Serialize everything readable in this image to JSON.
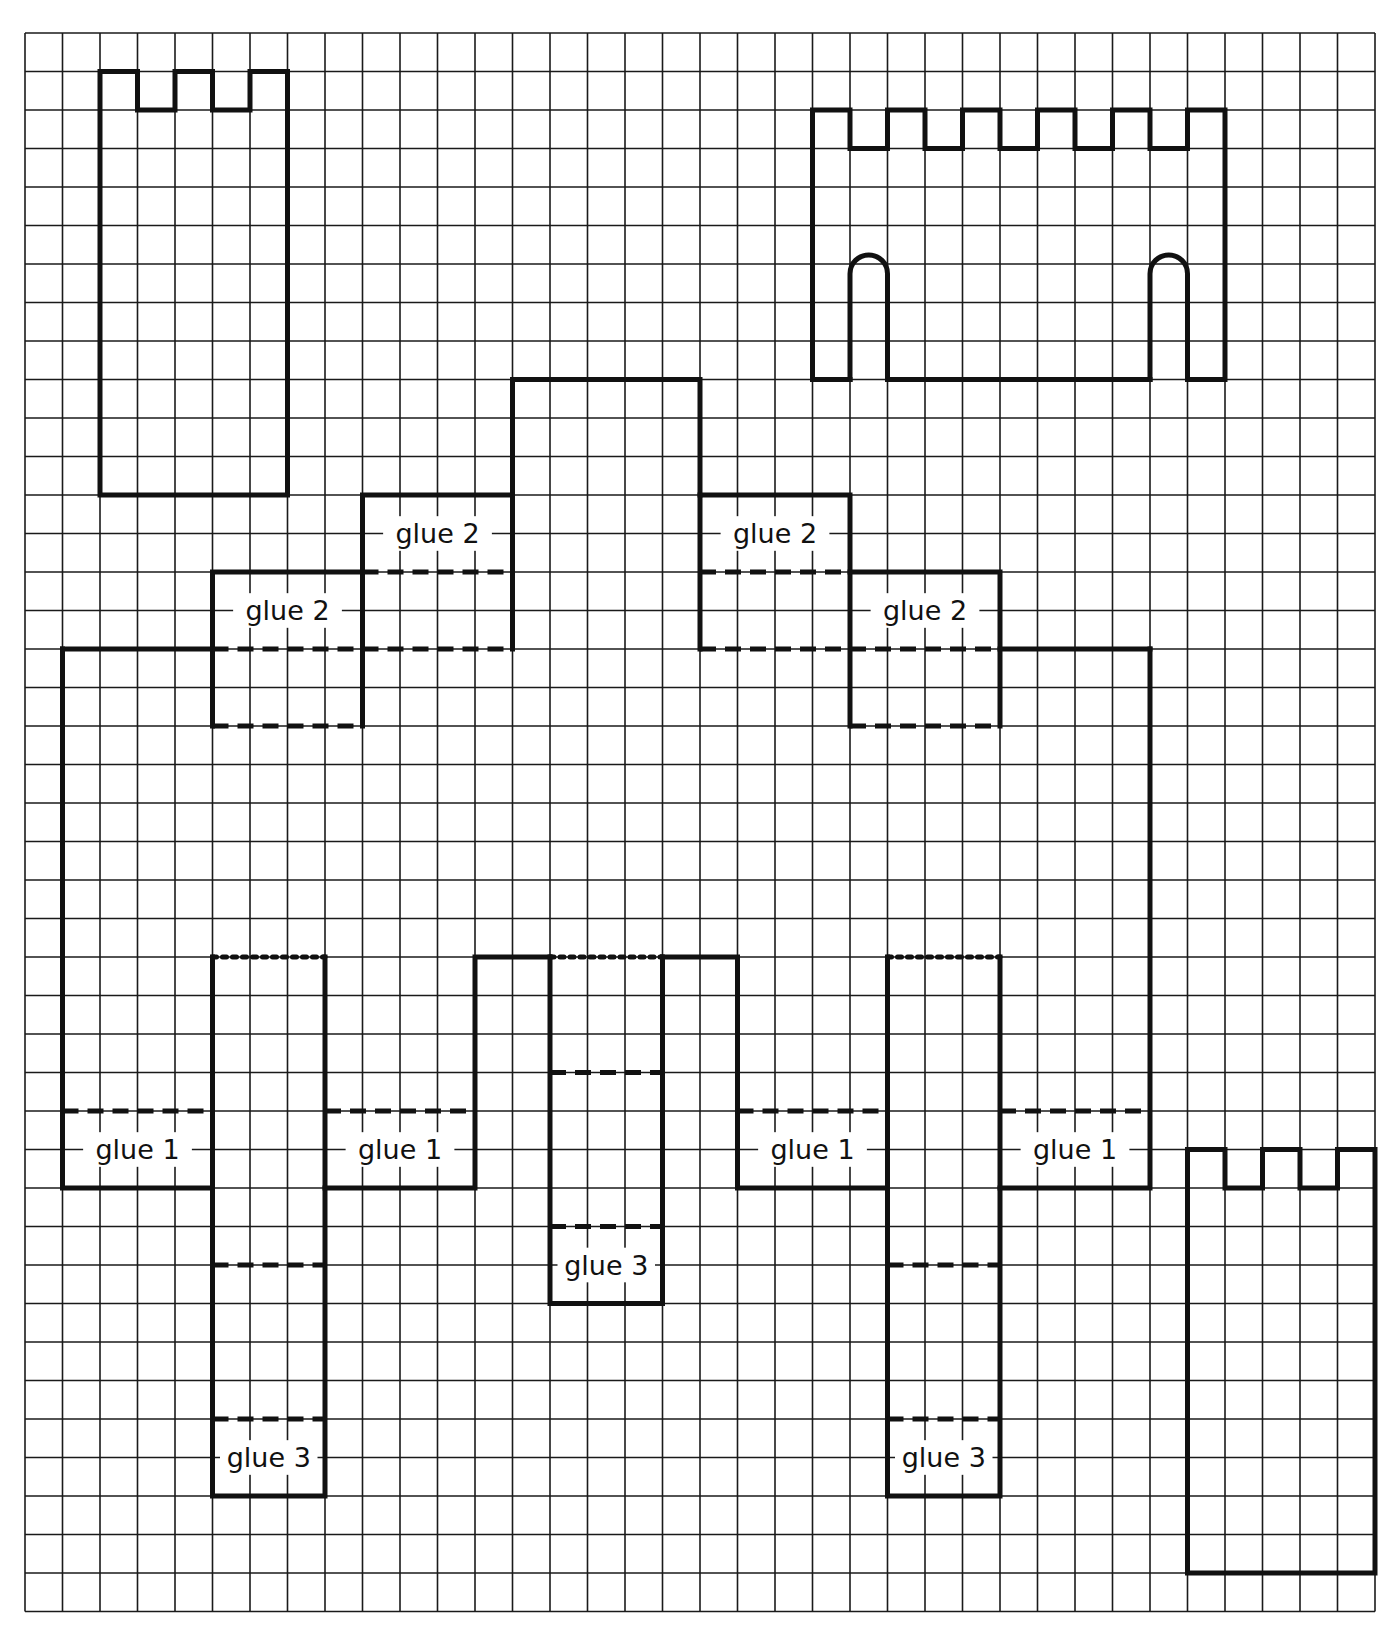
{
  "sheet": {
    "grid": {
      "cols": 36,
      "rows": 41,
      "origin_x": 25,
      "origin_y": 33,
      "cell_w": 37.5,
      "cell_h": 38.5
    },
    "colors": {
      "ink": "#111111",
      "grid": "#1a1a1a",
      "paper": "#ffffff"
    }
  },
  "pieces": [
    {
      "name": "tower-top-left",
      "cut_paths": [
        [
          [
            2,
            12
          ],
          [
            2,
            1
          ],
          [
            3,
            1
          ],
          [
            3,
            2
          ],
          [
            4,
            2
          ],
          [
            4,
            1
          ],
          [
            5,
            1
          ],
          [
            5,
            2
          ],
          [
            6,
            2
          ],
          [
            6,
            1
          ],
          [
            7,
            1
          ],
          [
            7,
            12
          ],
          [
            2,
            12
          ]
        ]
      ]
    },
    {
      "name": "gatehouse-wall-top-right",
      "cut_paths": [
        [
          [
            21,
            9
          ],
          [
            21,
            2
          ],
          [
            22,
            2
          ],
          [
            22,
            3
          ],
          [
            23,
            3
          ],
          [
            23,
            2
          ],
          [
            24,
            2
          ],
          [
            24,
            3
          ],
          [
            25,
            3
          ],
          [
            25,
            2
          ],
          [
            26,
            2
          ],
          [
            26,
            3
          ],
          [
            27,
            3
          ],
          [
            27,
            2
          ],
          [
            28,
            2
          ],
          [
            28,
            3
          ],
          [
            29,
            3
          ],
          [
            29,
            2
          ],
          [
            30,
            2
          ],
          [
            30,
            3
          ],
          [
            31,
            3
          ],
          [
            31,
            2
          ],
          [
            32,
            2
          ],
          [
            32,
            9
          ],
          [
            31,
            9
          ]
        ],
        [
          [
            23,
            9
          ],
          [
            30,
            9
          ]
        ],
        [
          [
            21,
            9
          ],
          [
            22,
            9
          ]
        ]
      ],
      "arches": [
        {
          "left_col": 22,
          "right_col": 23,
          "spring_row": 6.25,
          "base_row": 9
        },
        {
          "left_col": 30,
          "right_col": 31,
          "spring_row": 6.25,
          "base_row": 9
        }
      ]
    },
    {
      "name": "tower-bottom-right",
      "cut_paths": [
        [
          [
            31,
            40
          ],
          [
            31,
            29
          ],
          [
            32,
            29
          ],
          [
            32,
            30
          ],
          [
            33,
            30
          ],
          [
            33,
            29
          ],
          [
            34,
            29
          ],
          [
            34,
            30
          ],
          [
            35,
            30
          ],
          [
            35,
            29
          ],
          [
            36,
            29
          ],
          [
            36,
            40
          ],
          [
            31,
            40
          ]
        ]
      ]
    },
    {
      "name": "castle-keep-net",
      "cut_paths": [
        [
          [
            13,
            12
          ],
          [
            13,
            9
          ],
          [
            18,
            9
          ],
          [
            18,
            12
          ]
        ],
        [
          [
            9,
            18
          ],
          [
            9,
            12
          ],
          [
            13,
            12
          ],
          [
            13,
            16
          ]
        ],
        [
          [
            5,
            18
          ],
          [
            5,
            14
          ],
          [
            9,
            14
          ]
        ],
        [
          [
            1,
            16
          ],
          [
            5,
            16
          ]
        ],
        [
          [
            22,
            18
          ],
          [
            22,
            12
          ],
          [
            18,
            12
          ],
          [
            18,
            16
          ]
        ],
        [
          [
            26,
            18
          ],
          [
            26,
            14
          ],
          [
            22,
            14
          ]
        ],
        [
          [
            26,
            16
          ],
          [
            30,
            16
          ]
        ],
        [
          [
            1,
            16
          ],
          [
            1,
            30
          ],
          [
            5,
            30
          ]
        ],
        [
          [
            30,
            16
          ],
          [
            30,
            30
          ],
          [
            26,
            30
          ]
        ],
        [
          [
            5,
            24
          ],
          [
            5,
            38
          ],
          [
            8,
            38
          ],
          [
            8,
            24
          ]
        ],
        [
          [
            8,
            30
          ],
          [
            12,
            30
          ],
          [
            12,
            24
          ],
          [
            14,
            24
          ]
        ],
        [
          [
            14,
            24
          ],
          [
            14,
            33
          ],
          [
            17,
            33
          ],
          [
            17,
            24
          ]
        ],
        [
          [
            17,
            24
          ],
          [
            19,
            24
          ],
          [
            19,
            30
          ],
          [
            23,
            30
          ]
        ],
        [
          [
            23,
            24
          ],
          [
            23,
            38
          ],
          [
            26,
            38
          ],
          [
            26,
            24
          ]
        ]
      ],
      "fold_lines": [
        [
          [
            9,
            14
          ],
          [
            13,
            14
          ]
        ],
        [
          [
            5,
            16
          ],
          [
            13,
            16
          ]
        ],
        [
          [
            5,
            18
          ],
          [
            9,
            18
          ]
        ],
        [
          [
            18,
            14
          ],
          [
            22,
            14
          ]
        ],
        [
          [
            18,
            16
          ],
          [
            26,
            16
          ]
        ],
        [
          [
            22,
            18
          ],
          [
            26,
            18
          ]
        ],
        [
          [
            1,
            28
          ],
          [
            5,
            28
          ]
        ],
        [
          [
            8,
            28
          ],
          [
            12,
            28
          ]
        ],
        [
          [
            19,
            28
          ],
          [
            23,
            28
          ]
        ],
        [
          [
            26,
            28
          ],
          [
            30,
            28
          ]
        ],
        [
          [
            5,
            32
          ],
          [
            8,
            32
          ]
        ],
        [
          [
            5,
            36
          ],
          [
            8,
            36
          ]
        ],
        [
          [
            14,
            27
          ],
          [
            17,
            27
          ]
        ],
        [
          [
            14,
            31
          ],
          [
            17,
            31
          ]
        ],
        [
          [
            23,
            32
          ],
          [
            26,
            32
          ]
        ],
        [
          [
            23,
            36
          ],
          [
            26,
            36
          ]
        ]
      ],
      "score_lines": [
        [
          [
            5,
            24
          ],
          [
            8,
            24
          ]
        ],
        [
          [
            14,
            24
          ],
          [
            17,
            24
          ]
        ],
        [
          [
            23,
            24
          ],
          [
            26,
            24
          ]
        ]
      ]
    }
  ],
  "labels": [
    {
      "text": "glue 2",
      "col": 11,
      "row": 13,
      "w": 2.9
    },
    {
      "text": "glue 2",
      "col": 7,
      "row": 15,
      "w": 2.9
    },
    {
      "text": "glue 2",
      "col": 20,
      "row": 13,
      "w": 2.9
    },
    {
      "text": "glue 2",
      "col": 24,
      "row": 15,
      "w": 2.9
    },
    {
      "text": "glue 1",
      "col": 3,
      "row": 29,
      "w": 2.9
    },
    {
      "text": "glue 1",
      "col": 10,
      "row": 29,
      "w": 2.9
    },
    {
      "text": "glue 1",
      "col": 21,
      "row": 29,
      "w": 2.9
    },
    {
      "text": "glue 1",
      "col": 28,
      "row": 29,
      "w": 2.9
    },
    {
      "text": "glue 3",
      "col": 6.5,
      "row": 37,
      "w": 2.6
    },
    {
      "text": "glue 3",
      "col": 15.5,
      "row": 32,
      "w": 2.6
    },
    {
      "text": "glue 3",
      "col": 24.5,
      "row": 37,
      "w": 2.6
    }
  ]
}
